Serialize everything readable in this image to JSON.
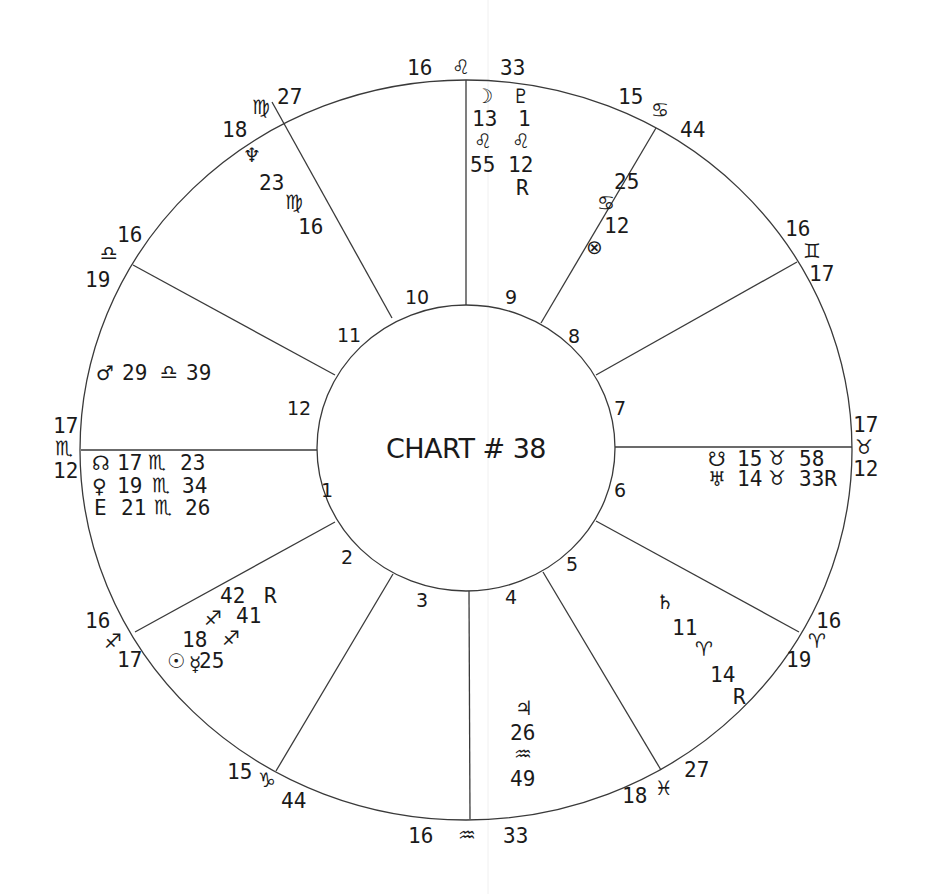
{
  "chart": {
    "title": "CHART # 38",
    "houses": [
      "1",
      "2",
      "3",
      "4",
      "5",
      "6",
      "7",
      "8",
      "9",
      "10",
      "11",
      "12"
    ],
    "cusps": {
      "c10": {
        "deg": "16",
        "sign": "♌",
        "min": "33"
      },
      "c11": {
        "deg": "18",
        "sign": "♍",
        "min": "27"
      },
      "c12": {
        "deg": "16",
        "sign": "♎",
        "min": "19"
      },
      "c1": {
        "deg": "17",
        "sign": "♏",
        "min": "12"
      },
      "c2": {
        "deg": "16",
        "sign": "♐",
        "min": "17"
      },
      "c3": {
        "deg": "15",
        "sign": "♑",
        "min": "44"
      },
      "c4": {
        "deg": "16",
        "sign": "♒",
        "min": "33"
      },
      "c5": {
        "deg": "18",
        "sign": "♓",
        "min": "27"
      },
      "c6": {
        "deg": "16",
        "sign": "♈",
        "min": "19"
      },
      "c7": {
        "deg": "17",
        "sign": "♉",
        "min": "12"
      },
      "c8": {
        "deg": "16",
        "sign": "♊",
        "min": "17"
      },
      "c9": {
        "deg": "15",
        "sign": "♋",
        "min": "44"
      }
    },
    "planets": {
      "moon": {
        "glyph": "☽",
        "deg": "13",
        "sign": "♌",
        "min": "55"
      },
      "pluto": {
        "glyph": "♇",
        "deg": "1",
        "sign": "♌",
        "min": "12",
        "retro": "R"
      },
      "neptune": {
        "glyph": "♆",
        "deg": "23",
        "sign": "♍",
        "min": "16"
      },
      "fortune": {
        "glyph": "⊗",
        "deg": "12",
        "sign": "♋",
        "min": "25"
      },
      "mars": {
        "glyph": "♂",
        "text": "29",
        "sign": "♎",
        "min": "39"
      },
      "node": {
        "glyph": "☊",
        "text": "17",
        "sign": "♏",
        "min": "23"
      },
      "venus": {
        "glyph": "♀",
        "text": "19",
        "sign": "♏",
        "min": "34"
      },
      "earth": {
        "glyph": "E",
        "text": "21",
        "sign": "♏",
        "min": "26"
      },
      "southnode": {
        "glyph": "☋",
        "text": "15",
        "sign": "♉",
        "min": "58"
      },
      "uranus": {
        "glyph": "♅",
        "text": "14",
        "sign": "♉",
        "min": "33R"
      },
      "saturn": {
        "glyph": "♄",
        "deg": "11",
        "sign": "♈",
        "min": "14",
        "retro": "R"
      },
      "jupiter": {
        "glyph": "♃",
        "deg": "26",
        "sign": "♒",
        "min": "49"
      },
      "sun": {
        "glyph": "☉",
        "deg": "18",
        "sign": "♐",
        "min": "25"
      },
      "mercury": {
        "glyph": "☿",
        "deg": "41",
        "sign": "♐",
        "min": "42",
        "retro": "R",
        "sign2": "♐"
      }
    }
  }
}
